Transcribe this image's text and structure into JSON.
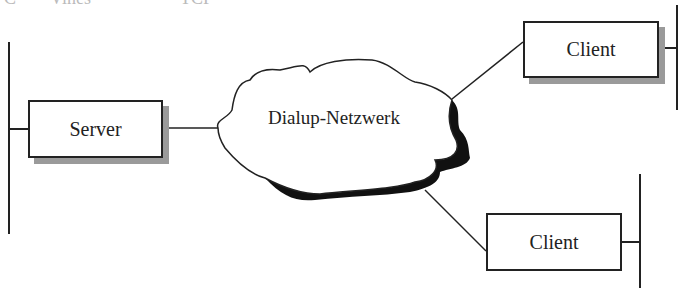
{
  "diagram": {
    "network": {
      "label": "Dialup-Netzwerk"
    },
    "nodes": [
      {
        "id": "server",
        "label": "Server"
      },
      {
        "id": "client1",
        "label": "Client"
      },
      {
        "id": "client2",
        "label": "Client"
      }
    ],
    "top_fragments": [
      "C",
      "Vines",
      "TCP"
    ]
  }
}
